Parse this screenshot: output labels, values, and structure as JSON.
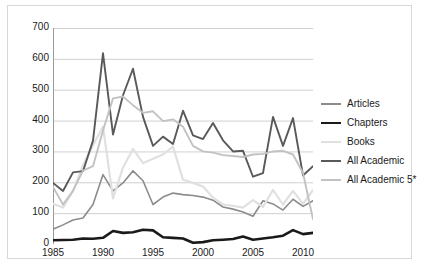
{
  "chart_data": {
    "type": "line",
    "title": "",
    "xlabel": "",
    "ylabel": "",
    "xlim": [
      1985,
      2011
    ],
    "ylim": [
      0,
      700
    ],
    "ytick_step": 100,
    "yticks": [
      0,
      100,
      200,
      300,
      400,
      500,
      600,
      700
    ],
    "xticks": [
      1985,
      1986,
      1987,
      1988,
      1989,
      1990,
      1991,
      1992,
      1993,
      1994,
      1995,
      1996,
      1997,
      1998,
      1999,
      2000,
      2001,
      2002,
      2003,
      2004,
      2005,
      2006,
      2007,
      2008,
      2009,
      2010,
      2011
    ],
    "xtick_labels": [
      1985,
      1990,
      1995,
      2000,
      2005,
      2010
    ],
    "grid": "horizontal",
    "legend_position": "right",
    "x": [
      1985,
      1986,
      1987,
      1988,
      1989,
      1990,
      1991,
      1992,
      1993,
      1994,
      1995,
      1996,
      1997,
      1998,
      1999,
      2000,
      2001,
      2002,
      2003,
      2004,
      2005,
      2006,
      2007,
      2008,
      2009,
      2010,
      2011
    ],
    "series": [
      {
        "name": "Articles",
        "color": "#8c8c8c",
        "width": 1.6,
        "values": [
          48,
          62,
          78,
          84,
          128,
          225,
          172,
          198,
          237,
          205,
          128,
          152,
          165,
          160,
          157,
          152,
          142,
          120,
          113,
          104,
          90,
          140,
          130,
          110,
          145,
          122,
          140
        ]
      },
      {
        "name": "Chapters",
        "color": "#1a1a1a",
        "width": 2.6,
        "values": [
          12,
          13,
          14,
          18,
          17,
          20,
          42,
          36,
          38,
          46,
          44,
          22,
          20,
          18,
          4,
          6,
          12,
          14,
          16,
          24,
          14,
          18,
          22,
          27,
          45,
          32,
          36
        ]
      },
      {
        "name": "Books",
        "color": "#e0e0e0",
        "width": 2.2,
        "values": [
          130,
          118,
          172,
          255,
          320,
          380,
          148,
          248,
          308,
          262,
          276,
          290,
          316,
          208,
          198,
          186,
          150,
          128,
          124,
          118,
          142,
          120,
          175,
          128,
          172,
          130,
          175
        ]
      },
      {
        "name": "All Academic",
        "color": "#595959",
        "width": 1.9,
        "values": [
          198,
          172,
          232,
          236,
          335,
          618,
          355,
          482,
          568,
          412,
          318,
          348,
          324,
          432,
          352,
          340,
          392,
          336,
          300,
          302,
          218,
          230,
          412,
          318,
          408,
          222,
          252
        ]
      },
      {
        "name": "All Academic 5*",
        "color": "#c2c2c2",
        "width": 1.9,
        "values": [
          185,
          128,
          172,
          238,
          252,
          368,
          472,
          478,
          450,
          425,
          430,
          398,
          404,
          380,
          318,
          300,
          296,
          288,
          285,
          282,
          290,
          292,
          300,
          302,
          290,
          230,
          80
        ]
      }
    ]
  },
  "legend": {
    "items": [
      {
        "label": "Articles"
      },
      {
        "label": "Chapters"
      },
      {
        "label": "Books"
      },
      {
        "label": "All Academic"
      },
      {
        "label": "All Academic 5*"
      }
    ]
  },
  "style": {
    "grid_color": "#d0d0d0",
    "axis_color": "#9a9a9a",
    "text_color": "#1a1a1a",
    "frame_color": "#d9d9d9",
    "background": "#ffffff"
  }
}
